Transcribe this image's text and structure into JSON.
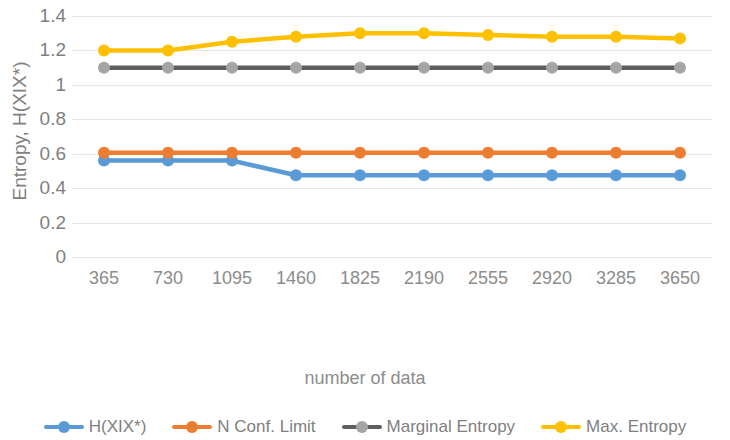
{
  "chart_data": {
    "type": "line",
    "title": "",
    "xlabel": "number of data",
    "ylabel": "Entropy, H(XIX*)",
    "categories": [
      365,
      730,
      1095,
      1460,
      1825,
      2190,
      2555,
      2920,
      3285,
      3650
    ],
    "x_tick_labels": [
      "365",
      "730",
      "1095",
      "1460",
      "1825",
      "2190",
      "2555",
      "2920",
      "3285",
      "3650"
    ],
    "y_tick_labels": [
      "1.4",
      "1.2",
      "1",
      "0.8",
      "0.6",
      "0.4",
      "0.2",
      "0"
    ],
    "y_tick_values": [
      1.4,
      1.2,
      1.0,
      0.8,
      0.6,
      0.4,
      0.2,
      0
    ],
    "ylim": [
      0,
      1.4
    ],
    "grid": true,
    "grid_axis": "y",
    "legend_position": "bottom",
    "series": [
      {
        "name": "H(XIX*)",
        "color": "#5b9bd5",
        "marker": "circle",
        "values": [
          0.56,
          0.56,
          0.56,
          0.475,
          0.475,
          0.475,
          0.475,
          0.475,
          0.475,
          0.475
        ]
      },
      {
        "name": "N Conf. Limit",
        "color": "#ed7d31",
        "marker": "circle",
        "values": [
          0.605,
          0.605,
          0.605,
          0.605,
          0.605,
          0.605,
          0.605,
          0.605,
          0.605,
          0.605
        ]
      },
      {
        "name": "Marginal Entropy",
        "color": "#5f5f5f",
        "marker": "circle",
        "marker_color": "#a5a5a5",
        "values": [
          1.1,
          1.1,
          1.1,
          1.1,
          1.1,
          1.1,
          1.1,
          1.1,
          1.1,
          1.1
        ]
      },
      {
        "name": "Max. Entropy",
        "color": "#ffc000",
        "marker": "circle",
        "values": [
          1.2,
          1.2,
          1.25,
          1.28,
          1.3,
          1.3,
          1.29,
          1.28,
          1.28,
          1.27
        ]
      }
    ]
  },
  "axes": {
    "y_title": "Entropy, H(XIX*)",
    "x_title": "number of data"
  },
  "colors": {
    "series_blue": "#5b9bd5",
    "series_orange": "#ed7d31",
    "series_gray": "#5f5f5f",
    "series_gray_marker": "#a5a5a5",
    "series_yellow": "#ffc000",
    "gridline": "#e6e6e6",
    "tick_text": "#7f7f7f",
    "background": "#ffffff"
  }
}
